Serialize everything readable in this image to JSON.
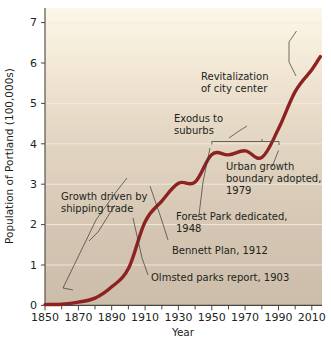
{
  "chart_data": {
    "type": "line",
    "title": "",
    "xlabel": "Year",
    "ylabel": "Population of Portland (100,000s)",
    "xlim": [
      1850,
      2016
    ],
    "ylim": [
      0,
      7.35
    ],
    "grid": true,
    "legend": "none",
    "x_ticks": [
      "1850",
      "1870",
      "1890",
      "1910",
      "1930",
      "1950",
      "1970",
      "1990",
      "2010"
    ],
    "x_tick_values": [
      1850,
      1870,
      1890,
      1910,
      1930,
      1950,
      1970,
      1990,
      2010
    ],
    "x_minor_tick_values": [
      1860,
      1880,
      1900,
      1920,
      1940,
      1960,
      1980,
      2000
    ],
    "y_ticks": [
      "0",
      "1",
      "2",
      "3",
      "4",
      "5",
      "6",
      "7"
    ],
    "y_tick_values": [
      0,
      1,
      2,
      3,
      4,
      5,
      6,
      7
    ],
    "series": [
      {
        "name": "Population of Portland",
        "color": "#8e2222",
        "x": [
          1850,
          1860,
          1870,
          1880,
          1890,
          1900,
          1910,
          1920,
          1930,
          1940,
          1950,
          1960,
          1970,
          1980,
          1990,
          2000,
          2010,
          2015
        ],
        "values": [
          0.02,
          0.03,
          0.08,
          0.18,
          0.46,
          0.91,
          2.07,
          2.58,
          3.02,
          3.05,
          3.73,
          3.72,
          3.82,
          3.66,
          4.37,
          5.29,
          5.83,
          6.15
        ]
      }
    ],
    "annotations": [
      {
        "name": "revitalization-of-city-center",
        "lines": [
          "Revitalization",
          "of city center"
        ],
        "anchor_year": 1995,
        "anchor_value": 5.05
      },
      {
        "name": "exodus-to-suburbs",
        "lines": [
          "Exodus to",
          "suburbs"
        ],
        "anchor_year": 1965,
        "anchor_value": 4.05,
        "bracket_from_year": 1950,
        "bracket_to_year": 1980
      },
      {
        "name": "urban-growth-boundary-adopted",
        "lines": [
          "Urban growth",
          "boundary adopted,",
          "1979"
        ],
        "anchor_year": 1980,
        "anchor_value": 3.66
      },
      {
        "name": "growth-driven-by-shipping-trade",
        "lines": [
          "Growth driven by",
          "shipping trade"
        ],
        "anchor_year": 1868,
        "anchor_value": 0.22
      },
      {
        "name": "forest-park-dedicated",
        "lines": [
          "Forest Park dedicated,",
          "1948"
        ],
        "anchor_year": 1949,
        "anchor_value": 3.72
      },
      {
        "name": "bennett-plan",
        "lines": [
          "Bennett Plan, 1912"
        ],
        "anchor_year": 1915,
        "anchor_value": 2.24
      },
      {
        "name": "olmsted-parks-report",
        "lines": [
          "Olmsted parks report, 1903"
        ],
        "anchor_year": 1905,
        "anchor_value": 1.42
      }
    ],
    "background": {
      "top_color": "#fbf4e4",
      "bottom_color": "#cbbfae"
    }
  }
}
